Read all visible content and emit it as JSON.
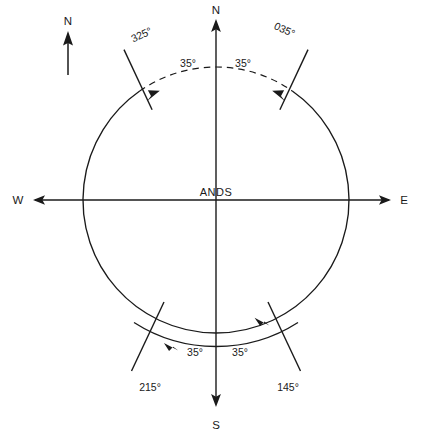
{
  "diagram": {
    "centre_label": "ANDS",
    "north_indicator": {
      "label": "N",
      "name": "north-arrow-indicator"
    },
    "cardinal_axes": [
      {
        "id": "north",
        "label": "N"
      },
      {
        "id": "south",
        "label": "S"
      },
      {
        "id": "east",
        "label": "E"
      },
      {
        "id": "west",
        "label": "W"
      }
    ],
    "bearings": [
      {
        "id": "brg-325",
        "label": "325°",
        "value": 325,
        "quadrant": "top-left"
      },
      {
        "id": "brg-035",
        "label": "035°",
        "value": 35,
        "quadrant": "top-right"
      },
      {
        "id": "brg-145",
        "label": "145°",
        "value": 145,
        "quadrant": "bottom-right"
      },
      {
        "id": "brg-215",
        "label": "215°",
        "value": 215,
        "quadrant": "bottom-left"
      }
    ],
    "angle_annotations": [
      {
        "id": "ang-top-left",
        "label": "35°",
        "value": 35
      },
      {
        "id": "ang-top-right",
        "label": "35°",
        "value": 35
      },
      {
        "id": "ang-bottom-left",
        "label": "35°",
        "value": 35
      },
      {
        "id": "ang-bottom-right",
        "label": "35°",
        "value": 35
      }
    ],
    "colors": {
      "ink": "#1a1a1a",
      "background": "#ffffff"
    }
  }
}
